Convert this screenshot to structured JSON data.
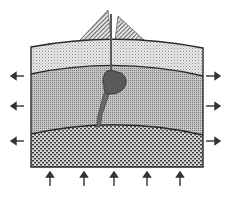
{
  "diagram": {
    "type": "geologic-cross-section",
    "layers": [
      {
        "id": "upper-crust",
        "pattern": "fine-stipple",
        "color": "#d9d9d9"
      },
      {
        "id": "lower-crust",
        "pattern": "dense-dots",
        "color": "#a8a8a8"
      },
      {
        "id": "mantle",
        "pattern": "coarse-dots",
        "color": "#7a7a7a"
      }
    ],
    "features": {
      "volcano": {
        "pattern": "diagonal-hatch"
      },
      "magma_chamber": {
        "color": "#5a5a5a"
      },
      "conduit": {
        "color": "#6a6a6a"
      }
    },
    "arrows": {
      "left": [
        "tension-left",
        "tension-left",
        "tension-left"
      ],
      "right": [
        "tension-right",
        "tension-right",
        "tension-right"
      ],
      "bottom": [
        "uplift",
        "uplift",
        "uplift",
        "uplift",
        "uplift"
      ]
    },
    "colors": {
      "outline": "#2a2a2a",
      "arrow": "#333333"
    }
  }
}
